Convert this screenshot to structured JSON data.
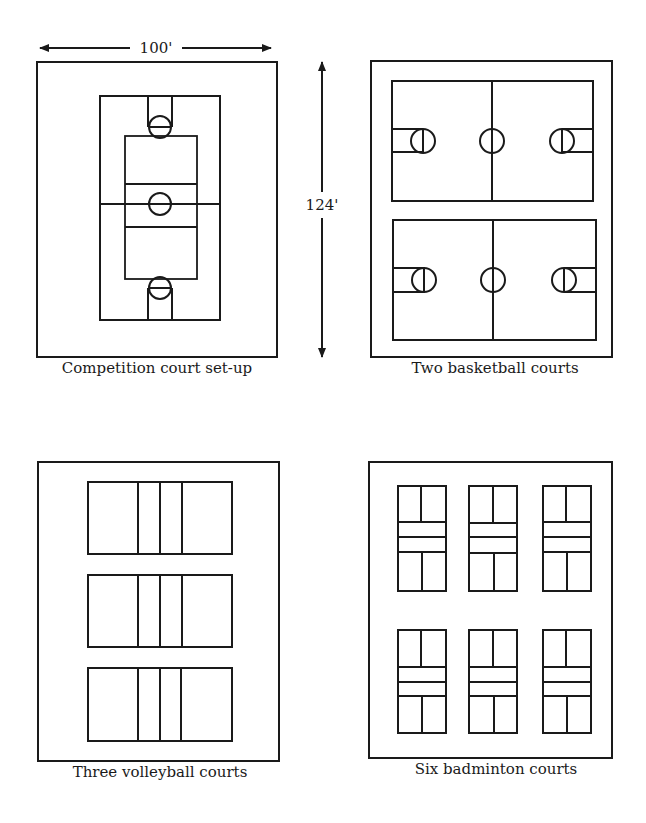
{
  "dimensions": {
    "width_label": "100'",
    "height_label": "124'"
  },
  "panels": [
    {
      "id": "competition",
      "caption": "Competition court set-up"
    },
    {
      "id": "basketball",
      "caption": "Two basketball courts"
    },
    {
      "id": "volleyball",
      "caption": "Three volleyball courts"
    },
    {
      "id": "badminton",
      "caption": "Six badminton courts"
    }
  ],
  "colors": {
    "line": "#1a1a1a",
    "background": "#ffffff"
  }
}
